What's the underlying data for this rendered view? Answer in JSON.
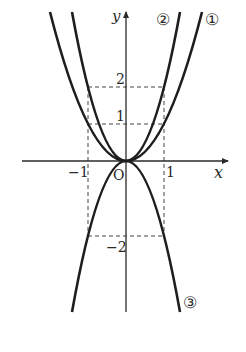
{
  "diagram": {
    "type": "function-graph",
    "axes": {
      "x_label": "x",
      "y_label": "y",
      "origin_label": "O"
    },
    "ticks": {
      "x_neg1": "−1",
      "x_pos1": "1",
      "y_pos1": "1",
      "y_pos2": "2",
      "y_neg2": "−2"
    },
    "curves": [
      {
        "id": 1,
        "marker": "①",
        "equation": "y = x^2"
      },
      {
        "id": 2,
        "marker": "②",
        "equation": "y = 2x^2"
      },
      {
        "id": 3,
        "marker": "③",
        "equation": "y = -2x^2"
      }
    ],
    "guides": [
      "dashed horizontal line y = 2 from x = -1 to 1",
      "dashed horizontal line y = 1 from x = -1 to 1",
      "dashed horizontal line y = -2 from x = -1 to 1",
      "dashed vertical lines x = -1 and x = 1 from y = 2 to y = -2"
    ],
    "colors": {
      "ink": "#2a2a2a",
      "background": "#ffffff"
    }
  }
}
